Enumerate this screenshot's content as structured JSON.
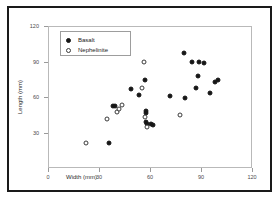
{
  "chart_data": {
    "type": "scatter",
    "title": "",
    "xlabel": "Width (mm)",
    "ylabel": "Length (mm)",
    "xlim": [
      0,
      120
    ],
    "ylim": [
      0,
      120
    ],
    "xticks": [
      0,
      30,
      60,
      90,
      120
    ],
    "yticks": [
      30,
      60,
      90,
      120
    ],
    "xtick_labels": [
      "0",
      "30",
      "60",
      "90",
      "120"
    ],
    "ytick_labels": [
      "30",
      "60",
      "90",
      "120"
    ],
    "grid": false,
    "legend_position": "top-left",
    "series": [
      {
        "name": "Basalt",
        "marker": "filled-circle",
        "color": "#161616",
        "points": [
          [
            36.0,
            21.5
          ],
          [
            38.5,
            52.5
          ],
          [
            39.5,
            52.0
          ],
          [
            49.0,
            66.5
          ],
          [
            53.5,
            61.5
          ],
          [
            57.5,
            48.0
          ],
          [
            57.5,
            46.5
          ],
          [
            57.0,
            74.5
          ],
          [
            57.5,
            38.5
          ],
          [
            58.5,
            37.5
          ],
          [
            60.5,
            37.0
          ],
          [
            61.5,
            36.5
          ],
          [
            71.5,
            60.5
          ],
          [
            80.5,
            59.5
          ],
          [
            80.0,
            97.0
          ],
          [
            84.5,
            89.5
          ],
          [
            88.0,
            77.5
          ],
          [
            89.0,
            89.5
          ],
          [
            87.0,
            67.5
          ],
          [
            92.0,
            88.5
          ],
          [
            95.0,
            63.0
          ],
          [
            98.5,
            72.5
          ],
          [
            100.0,
            74.5
          ]
        ]
      },
      {
        "name": "Nephelinite",
        "marker": "open-circle",
        "color": "#3a3a3a",
        "points": [
          [
            22.5,
            21.0
          ],
          [
            34.5,
            41.5
          ],
          [
            40.5,
            47.5
          ],
          [
            41.5,
            49.5
          ],
          [
            43.5,
            53.5
          ],
          [
            55.0,
            67.5
          ],
          [
            56.5,
            90.0
          ],
          [
            57.0,
            43.0
          ],
          [
            58.5,
            34.5
          ],
          [
            77.5,
            44.5
          ]
        ]
      }
    ]
  },
  "axes": {
    "x_title": "Width (mm)",
    "y_title": "Length (mm)"
  },
  "legend": {
    "items": [
      {
        "label": "Basalt",
        "marker": "filled-circle"
      },
      {
        "label": "Nephelinite",
        "marker": "open-circle"
      }
    ]
  }
}
